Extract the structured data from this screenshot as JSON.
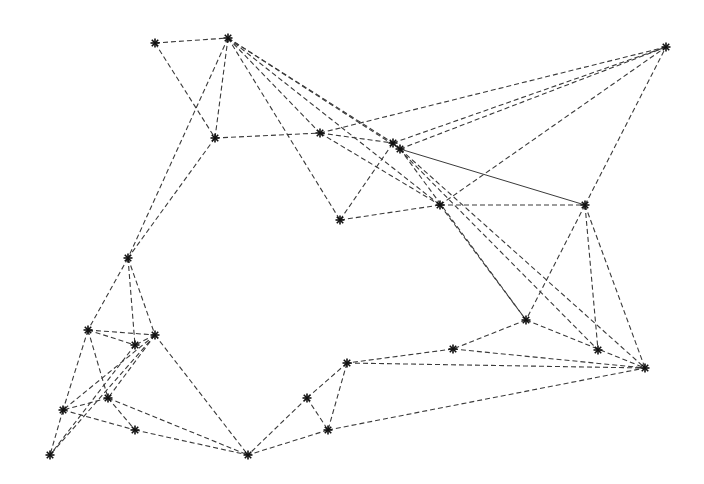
{
  "diagram": {
    "type": "undirected-graph",
    "edge_style": "dashed",
    "edge_color": "#3a3a3a",
    "node_marker": "asterisk",
    "node_color": "#111111",
    "nodes": [
      {
        "id": "A",
        "x": 155,
        "y": 43
      },
      {
        "id": "B",
        "x": 228,
        "y": 38
      },
      {
        "id": "C",
        "x": 666,
        "y": 47
      },
      {
        "id": "D",
        "x": 215,
        "y": 138
      },
      {
        "id": "E",
        "x": 320,
        "y": 133
      },
      {
        "id": "F",
        "x": 393,
        "y": 143
      },
      {
        "id": "G",
        "x": 400,
        "y": 149
      },
      {
        "id": "H",
        "x": 340,
        "y": 220
      },
      {
        "id": "I",
        "x": 440,
        "y": 205
      },
      {
        "id": "J",
        "x": 585,
        "y": 205
      },
      {
        "id": "K",
        "x": 128,
        "y": 258
      },
      {
        "id": "L",
        "x": 88,
        "y": 330
      },
      {
        "id": "M",
        "x": 135,
        "y": 345
      },
      {
        "id": "N",
        "x": 155,
        "y": 335
      },
      {
        "id": "O",
        "x": 526,
        "y": 320
      },
      {
        "id": "P",
        "x": 453,
        "y": 349
      },
      {
        "id": "Q",
        "x": 598,
        "y": 350
      },
      {
        "id": "R",
        "x": 645,
        "y": 368
      },
      {
        "id": "S",
        "x": 347,
        "y": 363
      },
      {
        "id": "T",
        "x": 307,
        "y": 398
      },
      {
        "id": "U",
        "x": 108,
        "y": 398
      },
      {
        "id": "V",
        "x": 63,
        "y": 410
      },
      {
        "id": "W",
        "x": 328,
        "y": 430
      },
      {
        "id": "X",
        "x": 135,
        "y": 430
      },
      {
        "id": "Y",
        "x": 248,
        "y": 455
      },
      {
        "id": "Z",
        "x": 50,
        "y": 455
      }
    ],
    "edges": [
      [
        "A",
        "B"
      ],
      [
        "A",
        "D"
      ],
      [
        "B",
        "K"
      ],
      [
        "B",
        "D"
      ],
      [
        "B",
        "H"
      ],
      [
        "B",
        "E"
      ],
      [
        "B",
        "F"
      ],
      [
        "B",
        "G"
      ],
      [
        "B",
        "I"
      ],
      [
        "D",
        "E"
      ],
      [
        "E",
        "F"
      ],
      [
        "E",
        "I"
      ],
      [
        "E",
        "C"
      ],
      [
        "F",
        "C"
      ],
      [
        "G",
        "C"
      ],
      [
        "G",
        "J",
        "solid"
      ],
      [
        "H",
        "I"
      ],
      [
        "H",
        "F"
      ],
      [
        "I",
        "C"
      ],
      [
        "I",
        "J"
      ],
      [
        "J",
        "C"
      ],
      [
        "I",
        "O"
      ],
      [
        "G",
        "O"
      ],
      [
        "F",
        "Q"
      ],
      [
        "G",
        "R"
      ],
      [
        "J",
        "O"
      ],
      [
        "J",
        "Q"
      ],
      [
        "J",
        "R"
      ],
      [
        "O",
        "P"
      ],
      [
        "O",
        "R"
      ],
      [
        "P",
        "S"
      ],
      [
        "P",
        "R"
      ],
      [
        "S",
        "R"
      ],
      [
        "S",
        "T"
      ],
      [
        "S",
        "W"
      ],
      [
        "T",
        "W"
      ],
      [
        "T",
        "Y"
      ],
      [
        "W",
        "R"
      ],
      [
        "W",
        "Y"
      ],
      [
        "D",
        "K"
      ],
      [
        "K",
        "L"
      ],
      [
        "K",
        "M"
      ],
      [
        "K",
        "N"
      ],
      [
        "L",
        "N"
      ],
      [
        "L",
        "M"
      ],
      [
        "L",
        "U"
      ],
      [
        "L",
        "V"
      ],
      [
        "N",
        "U"
      ],
      [
        "N",
        "V"
      ],
      [
        "N",
        "Z"
      ],
      [
        "N",
        "Y"
      ],
      [
        "M",
        "Z"
      ],
      [
        "U",
        "V"
      ],
      [
        "U",
        "X"
      ],
      [
        "V",
        "X"
      ],
      [
        "U",
        "Y"
      ],
      [
        "X",
        "Y"
      ],
      [
        "V",
        "Z"
      ],
      [
        "N",
        "M"
      ]
    ]
  }
}
